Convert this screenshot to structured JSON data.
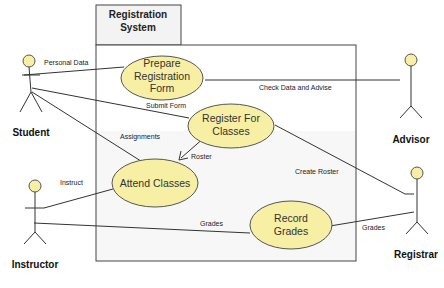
{
  "system": {
    "title_line1": "Registration",
    "title_line2": "System"
  },
  "actors": {
    "student": "Student",
    "advisor": "Advisor",
    "instructor": "Instructor",
    "registrar": "Registrar"
  },
  "use_cases": {
    "prepare_form": [
      "Prepare",
      "Registration",
      "Form"
    ],
    "register_classes": [
      "Register For",
      "Classes"
    ],
    "attend_classes": [
      "Attend Classes"
    ],
    "record_grades": [
      "Record",
      "Grades"
    ]
  },
  "associations": {
    "personal_data": "Personal Data",
    "submit_form": "Submit Form",
    "assignments": "Assignments",
    "check_data": "Check Data and Advise",
    "roster": "Roster",
    "create_roster": "Create Roster",
    "instruct": "Instruct",
    "grades_instructor": "Grades",
    "grades_registrar": "Grades"
  },
  "colors": {
    "use_case_fill": "#f7efa3",
    "system_header_fill": "#f3f3f3",
    "system_body_fill": "#f7f7f7"
  }
}
